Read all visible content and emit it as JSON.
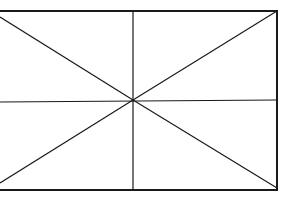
{
  "diagram": {
    "stroke_color": "#1a1a1a",
    "background_color": "#ffffff",
    "frame": {
      "left": 0,
      "top": 11,
      "right": 277,
      "bottom": 190
    },
    "center": {
      "x": 133,
      "y": 100
    },
    "lines": [
      {
        "name": "top-edge",
        "x1": 0,
        "y1": 11,
        "x2": 278,
        "y2": 11,
        "w": 2
      },
      {
        "name": "bottom-edge",
        "x1": 0,
        "y1": 190,
        "x2": 278,
        "y2": 190,
        "w": 2
      },
      {
        "name": "right-edge",
        "x1": 277,
        "y1": 11,
        "x2": 277,
        "y2": 190,
        "w": 2
      },
      {
        "name": "vertical-center",
        "x1": 133,
        "y1": 11,
        "x2": 133,
        "y2": 190,
        "w": 1.2
      },
      {
        "name": "horizontal-center",
        "x1": 0,
        "y1": 102,
        "x2": 277,
        "y2": 100,
        "w": 1.2
      },
      {
        "name": "diagonal-upper-left",
        "x1": 0,
        "y1": 17,
        "x2": 133,
        "y2": 100,
        "w": 1.2
      },
      {
        "name": "diagonal-lower-right",
        "x1": 133,
        "y1": 100,
        "x2": 277,
        "y2": 188,
        "w": 1.2
      },
      {
        "name": "diagonal-lower-left",
        "x1": 0,
        "y1": 183,
        "x2": 133,
        "y2": 100,
        "w": 1.2
      },
      {
        "name": "diagonal-upper-right",
        "x1": 133,
        "y1": 100,
        "x2": 277,
        "y2": 11,
        "w": 1.2
      }
    ]
  }
}
